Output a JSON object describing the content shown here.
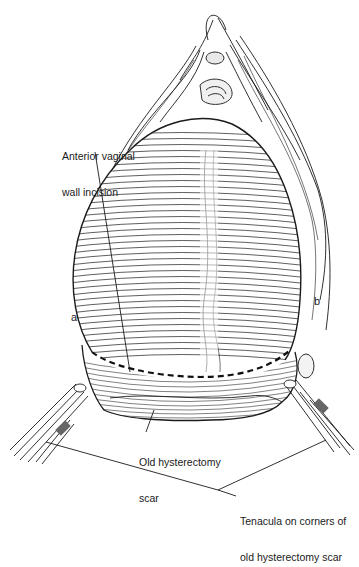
{
  "figure": {
    "type": "surgical line illustration",
    "ink_color": "#1a1a1a",
    "background": "#ffffff"
  },
  "labels": {
    "incision": {
      "line1": "Anterior vaginal",
      "line2": "wall incision"
    },
    "point_a": "a",
    "point_b": "b",
    "scar": {
      "line1": "Old hysterectomy",
      "line2": "scar"
    },
    "tenacula": {
      "line1": "Tenacula on corners of",
      "line2": "old hysterectomy scar"
    }
  }
}
